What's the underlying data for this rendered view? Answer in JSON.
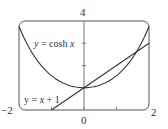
{
  "chart_data": {
    "type": "line",
    "title": "",
    "xlabel": "",
    "ylabel": "",
    "xlim": [
      -2,
      2
    ],
    "ylim": [
      0,
      4
    ],
    "grid": false,
    "frame": "rounded-rectangle",
    "tick_labels": {
      "x_left": "−2",
      "x_center": "0",
      "x_right": "2",
      "y_top": "4"
    },
    "x_ticks": [
      -1,
      0,
      1
    ],
    "y_ticks": [
      1,
      2,
      3
    ],
    "series": [
      {
        "name": "y = cosh x",
        "function": "cosh",
        "label_parts": [
          "y",
          " = cosh ",
          "x"
        ],
        "x": [
          -2,
          -1.5,
          -1,
          -0.5,
          0,
          0.5,
          1,
          1.5,
          2
        ],
        "values": [
          3.76,
          2.35,
          1.54,
          1.13,
          1.0,
          1.13,
          1.54,
          2.35,
          3.76
        ]
      },
      {
        "name": "y = x + 1",
        "function": "linear",
        "label_parts": [
          "y",
          " = ",
          "x",
          " + 1"
        ],
        "x": [
          -1,
          0,
          1,
          2
        ],
        "values": [
          0,
          1,
          2,
          3
        ]
      }
    ],
    "intersections": [
      [
        0,
        1
      ],
      [
        1.6,
        2.6
      ]
    ],
    "color": "#333333"
  }
}
